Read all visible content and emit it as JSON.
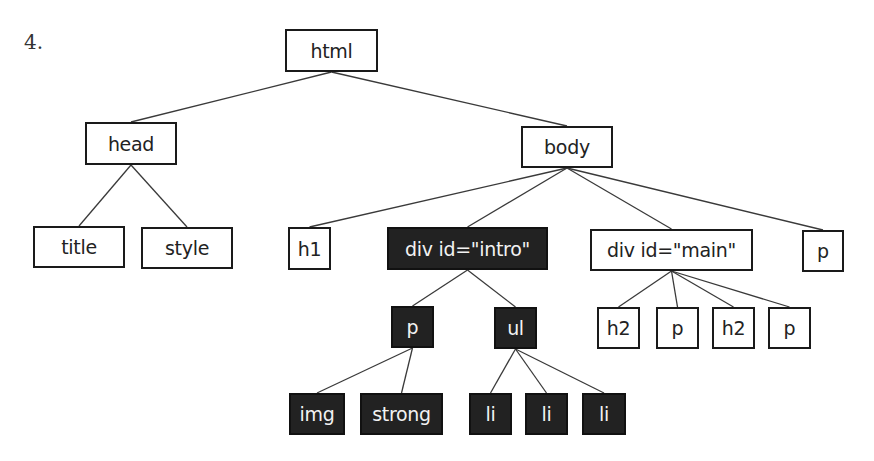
{
  "figure_number": "4.",
  "nodes": {
    "html": {
      "label": "html",
      "x": 285,
      "y": 29,
      "w": 93,
      "h": 43,
      "highlighted": false
    },
    "head": {
      "label": "head",
      "x": 85,
      "y": 122,
      "w": 92,
      "h": 43,
      "highlighted": false
    },
    "body": {
      "label": "body",
      "x": 521,
      "y": 126,
      "w": 92,
      "h": 42,
      "highlighted": false
    },
    "title": {
      "label": "title",
      "x": 33,
      "y": 226,
      "w": 92,
      "h": 42,
      "highlighted": false
    },
    "style": {
      "label": "style",
      "x": 141,
      "y": 227,
      "w": 92,
      "h": 42,
      "highlighted": false
    },
    "h1": {
      "label": "h1",
      "x": 288,
      "y": 227,
      "w": 43,
      "h": 43,
      "highlighted": false
    },
    "div_intro": {
      "label": "div id=\"intro\"",
      "x": 387,
      "y": 227,
      "w": 161,
      "h": 43,
      "highlighted": true
    },
    "div_main": {
      "label": "div id=\"main\"",
      "x": 590,
      "y": 229,
      "w": 163,
      "h": 42,
      "highlighted": false
    },
    "p_body": {
      "label": "p",
      "x": 802,
      "y": 230,
      "w": 42,
      "h": 42,
      "highlighted": false
    },
    "p_intro": {
      "label": "p",
      "x": 391,
      "y": 306,
      "w": 43,
      "h": 42,
      "highlighted": true
    },
    "ul": {
      "label": "ul",
      "x": 494,
      "y": 307,
      "w": 43,
      "h": 42,
      "highlighted": true
    },
    "h2_a": {
      "label": "h2",
      "x": 597,
      "y": 307,
      "w": 43,
      "h": 42,
      "highlighted": false
    },
    "p_main_a": {
      "label": "p",
      "x": 656,
      "y": 307,
      "w": 43,
      "h": 42,
      "highlighted": false
    },
    "h2_b": {
      "label": "h2",
      "x": 712,
      "y": 307,
      "w": 43,
      "h": 42,
      "highlighted": false
    },
    "p_main_b": {
      "label": "p",
      "x": 768,
      "y": 307,
      "w": 43,
      "h": 42,
      "highlighted": false
    },
    "img": {
      "label": "img",
      "x": 289,
      "y": 393,
      "w": 56,
      "h": 42,
      "highlighted": true
    },
    "strong": {
      "label": "strong",
      "x": 360,
      "y": 393,
      "w": 83,
      "h": 42,
      "highlighted": true
    },
    "li_1": {
      "label": "li",
      "x": 469,
      "y": 393,
      "w": 43,
      "h": 42,
      "highlighted": true
    },
    "li_2": {
      "label": "li",
      "x": 525,
      "y": 393,
      "w": 43,
      "h": 42,
      "highlighted": true
    },
    "li_3": {
      "label": "li",
      "x": 582,
      "y": 393,
      "w": 44,
      "h": 42,
      "highlighted": true
    }
  },
  "edges": [
    [
      "html",
      "head"
    ],
    [
      "html",
      "body"
    ],
    [
      "head",
      "title"
    ],
    [
      "head",
      "style"
    ],
    [
      "body",
      "h1"
    ],
    [
      "body",
      "div_intro"
    ],
    [
      "body",
      "div_main"
    ],
    [
      "body",
      "p_body"
    ],
    [
      "div_intro",
      "p_intro"
    ],
    [
      "div_intro",
      "ul"
    ],
    [
      "div_main",
      "h2_a"
    ],
    [
      "div_main",
      "p_main_a"
    ],
    [
      "div_main",
      "h2_b"
    ],
    [
      "div_main",
      "p_main_b"
    ],
    [
      "p_intro",
      "img"
    ],
    [
      "p_intro",
      "strong"
    ],
    [
      "ul",
      "li_1"
    ],
    [
      "ul",
      "li_2"
    ],
    [
      "ul",
      "li_3"
    ]
  ],
  "colors": {
    "highlight_fill": "#222222",
    "highlight_text": "#f2f2f2",
    "border": "#1a1a1a",
    "edge": "#3a3a3a"
  }
}
